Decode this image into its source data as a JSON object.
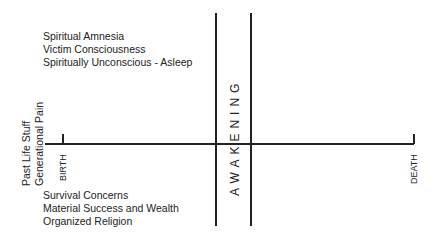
{
  "top_left": {
    "lines": [
      "Spiritual Amnesia",
      "Victim Consciousness",
      "Spiritually Unconscious - Asleep"
    ]
  },
  "bottom_left": {
    "lines": [
      "Survival Concerns",
      "Material Success and Wealth",
      "Organized Religion"
    ]
  },
  "side_label": {
    "lines": [
      "Past Life Stuff",
      "Generational Pain"
    ]
  },
  "axis": {
    "start_label": "BIRTH",
    "end_label": "DEATH",
    "band_label": "AWAKENING"
  }
}
